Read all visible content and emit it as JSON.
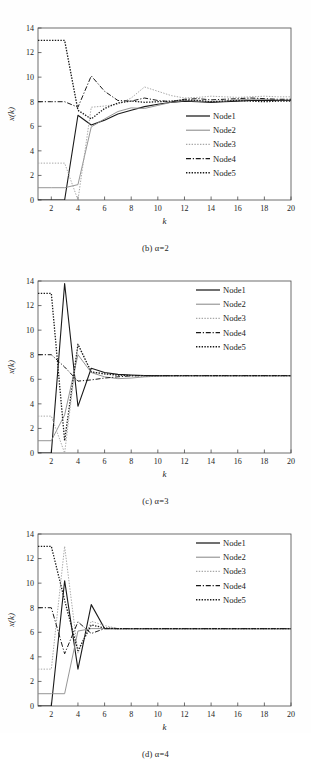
{
  "figure": {
    "panels": [
      {
        "caption_prefix": "(b)",
        "caption_alpha": "α=2",
        "caption": "(b) α=2",
        "legend_position": "inside-right-lower",
        "chart_data": {
          "type": "line",
          "title": "(b) α=2",
          "xlabel": "k",
          "ylabel": "x(k)",
          "xlim": [
            1,
            20
          ],
          "ylim": [
            0,
            14
          ],
          "xticks": [
            2,
            4,
            6,
            8,
            10,
            12,
            14,
            16,
            18,
            20
          ],
          "yticks": [
            0,
            2,
            4,
            6,
            8,
            10,
            12,
            14
          ],
          "grid": false,
          "legend": [
            "Node1",
            "Node2",
            "Node3",
            "Node4",
            "Node5"
          ],
          "x": [
            1,
            2,
            3,
            4,
            5,
            6,
            7,
            8,
            9,
            10,
            11,
            12,
            13,
            14,
            15,
            16,
            17,
            18,
            19,
            20
          ],
          "series": [
            {
              "name": "Node1",
              "style": "solid",
              "color": "#1a1a1a",
              "width": 1.1,
              "values": [
                0,
                0,
                0,
                6.9,
                6.1,
                6.5,
                7.0,
                7.3,
                7.6,
                7.8,
                7.95,
                8.05,
                8.0,
                7.95,
                8.0,
                8.05,
                8.1,
                8.12,
                8.1,
                8.1
              ]
            },
            {
              "name": "Node2",
              "style": "solid",
              "color": "#8a8a8a",
              "width": 0.9,
              "values": [
                1,
                1,
                1,
                1.25,
                5.95,
                6.6,
                7.2,
                7.5,
                7.45,
                7.7,
                7.95,
                8.1,
                8.05,
                8.0,
                8.05,
                8.15,
                8.2,
                8.2,
                8.15,
                8.15
              ]
            },
            {
              "name": "Node3",
              "style": "dotted",
              "color": "#a8a8a8",
              "width": 1.0,
              "values": [
                3,
                3,
                3,
                0.0,
                7.55,
                7.65,
                7.8,
                8.3,
                9.2,
                8.85,
                8.5,
                8.3,
                8.35,
                8.45,
                8.4,
                8.35,
                8.4,
                8.45,
                8.4,
                8.4
              ]
            },
            {
              "name": "Node4",
              "style": "dashdot",
              "color": "#1a1a1a",
              "width": 1.0,
              "values": [
                8,
                8,
                8,
                7.55,
                10.1,
                8.85,
                8.1,
                8.05,
                8.3,
                8.1,
                8.0,
                8.2,
                8.25,
                8.15,
                8.2,
                8.25,
                8.3,
                8.25,
                8.2,
                8.2
              ]
            },
            {
              "name": "Node5",
              "style": "dotted",
              "color": "#1a1a1a",
              "width": 1.3,
              "values": [
                13,
                13,
                13,
                7.3,
                6.6,
                7.45,
                7.9,
                8.05,
                7.95,
                8.0,
                8.05,
                8.15,
                8.1,
                8.0,
                8.05,
                8.1,
                8.05,
                8.0,
                8.05,
                8.05
              ]
            }
          ]
        }
      },
      {
        "caption_prefix": "(c)",
        "caption_alpha": "α=3",
        "caption": "(c) α=3",
        "legend_position": "inside-top-right",
        "chart_data": {
          "type": "line",
          "title": "(c) α=3",
          "xlabel": "k",
          "ylabel": "x(k)",
          "xlim": [
            1,
            20
          ],
          "ylim": [
            0,
            14
          ],
          "xticks": [
            2,
            4,
            6,
            8,
            10,
            12,
            14,
            16,
            18,
            20
          ],
          "yticks": [
            0,
            2,
            4,
            6,
            8,
            10,
            12,
            14
          ],
          "grid": false,
          "legend": [
            "Node1",
            "Node2",
            "Node3",
            "Node4",
            "Node5"
          ],
          "x": [
            1,
            2,
            3,
            4,
            5,
            6,
            7,
            8,
            9,
            10,
            11,
            12,
            13,
            14,
            15,
            16,
            17,
            18,
            19,
            20
          ],
          "series": [
            {
              "name": "Node1",
              "style": "solid",
              "color": "#1a1a1a",
              "width": 1.1,
              "values": [
                0,
                0,
                13.8,
                3.8,
                6.9,
                6.55,
                6.4,
                6.35,
                6.3,
                6.3,
                6.3,
                6.3,
                6.3,
                6.3,
                6.3,
                6.3,
                6.3,
                6.3,
                6.3,
                6.3
              ]
            },
            {
              "name": "Node2",
              "style": "solid",
              "color": "#8a8a8a",
              "width": 0.9,
              "values": [
                1,
                1,
                3.1,
                8.0,
                6.55,
                6.2,
                6.05,
                6.1,
                6.2,
                6.25,
                6.28,
                6.3,
                6.3,
                6.3,
                6.3,
                6.3,
                6.3,
                6.3,
                6.3,
                6.3
              ]
            },
            {
              "name": "Node3",
              "style": "dotted",
              "color": "#a8a8a8",
              "width": 1.0,
              "values": [
                3,
                3,
                0.0,
                8.8,
                6.6,
                6.4,
                6.3,
                6.3,
                6.3,
                6.3,
                6.3,
                6.3,
                6.3,
                6.3,
                6.3,
                6.3,
                6.3,
                6.3,
                6.3,
                6.3
              ]
            },
            {
              "name": "Node4",
              "style": "dashdot",
              "color": "#1a1a1a",
              "width": 1.0,
              "values": [
                8,
                8,
                7.0,
                5.85,
                5.95,
                6.1,
                6.2,
                6.28,
                6.3,
                6.3,
                6.3,
                6.3,
                6.3,
                6.3,
                6.3,
                6.3,
                6.3,
                6.3,
                6.3,
                6.3
              ]
            },
            {
              "name": "Node5",
              "style": "dotted",
              "color": "#1a1a1a",
              "width": 1.3,
              "values": [
                13,
                13,
                1.0,
                8.85,
                6.6,
                6.45,
                6.35,
                6.3,
                6.3,
                6.3,
                6.3,
                6.3,
                6.3,
                6.3,
                6.3,
                6.3,
                6.3,
                6.3,
                6.3,
                6.3
              ]
            }
          ]
        }
      },
      {
        "caption_prefix": "(d)",
        "caption_alpha": "α=4",
        "caption": "(d) α=4",
        "legend_position": "inside-top-right",
        "chart_data": {
          "type": "line",
          "title": "(d) α=4",
          "xlabel": "k",
          "ylabel": "x(k)",
          "xlim": [
            1,
            20
          ],
          "ylim": [
            0,
            14
          ],
          "xticks": [
            2,
            4,
            6,
            8,
            10,
            12,
            14,
            16,
            18,
            20
          ],
          "yticks": [
            0,
            2,
            4,
            6,
            8,
            10,
            12,
            14
          ],
          "grid": false,
          "legend": [
            "Node1",
            "Node2",
            "Node3",
            "Node4",
            "Node5"
          ],
          "x": [
            1,
            2,
            3,
            4,
            5,
            6,
            7,
            8,
            9,
            10,
            11,
            12,
            13,
            14,
            15,
            16,
            17,
            18,
            19,
            20
          ],
          "series": [
            {
              "name": "Node1",
              "style": "solid",
              "color": "#1a1a1a",
              "width": 1.1,
              "values": [
                0,
                0,
                10.2,
                3.0,
                8.25,
                6.3,
                6.3,
                6.3,
                6.3,
                6.3,
                6.3,
                6.3,
                6.3,
                6.3,
                6.3,
                6.3,
                6.3,
                6.3,
                6.3,
                6.3
              ]
            },
            {
              "name": "Node2",
              "style": "solid",
              "color": "#8a8a8a",
              "width": 0.9,
              "values": [
                1,
                1,
                1.0,
                6.1,
                6.3,
                6.3,
                6.3,
                6.3,
                6.3,
                6.3,
                6.3,
                6.3,
                6.3,
                6.3,
                6.3,
                6.3,
                6.3,
                6.3,
                6.3,
                6.3
              ]
            },
            {
              "name": "Node3",
              "style": "dotted",
              "color": "#a8a8a8",
              "width": 1.0,
              "values": [
                3,
                3,
                13.0,
                4.3,
                6.9,
                6.55,
                6.3,
                6.3,
                6.3,
                6.3,
                6.3,
                6.3,
                6.3,
                6.3,
                6.3,
                6.3,
                6.3,
                6.3,
                6.3,
                6.3
              ]
            },
            {
              "name": "Node4",
              "style": "dashdot",
              "color": "#1a1a1a",
              "width": 1.0,
              "values": [
                8,
                8,
                4.25,
                6.85,
                5.9,
                6.3,
                6.3,
                6.3,
                6.3,
                6.3,
                6.3,
                6.3,
                6.3,
                6.3,
                6.3,
                6.3,
                6.3,
                6.3,
                6.3,
                6.3
              ]
            },
            {
              "name": "Node5",
              "style": "dotted",
              "color": "#1a1a1a",
              "width": 1.3,
              "values": [
                13,
                13,
                8.6,
                4.5,
                6.6,
                6.35,
                6.3,
                6.3,
                6.3,
                6.3,
                6.3,
                6.3,
                6.3,
                6.3,
                6.3,
                6.3,
                6.3,
                6.3,
                6.3,
                6.3
              ]
            }
          ]
        }
      }
    ]
  }
}
